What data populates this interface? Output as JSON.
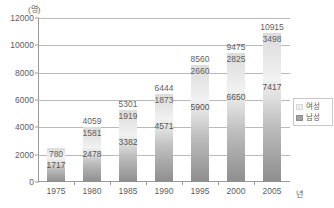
{
  "chart_data": {
    "type": "bar",
    "stacked": true,
    "title": "",
    "subtitle": "",
    "xlabel": "년",
    "ylabel": "",
    "yunit": "(명)",
    "ylim": [
      0,
      12000
    ],
    "ytick_labels": [
      "0",
      "2000",
      "4000",
      "6000",
      "8000",
      "10000",
      "12000"
    ],
    "ytick_values": [
      0,
      2000,
      4000,
      6000,
      8000,
      10000,
      12000
    ],
    "grid": true,
    "legend_position": "right",
    "categories": [
      "1975",
      "1980",
      "1985",
      "1990",
      "1995",
      "2000",
      "2005"
    ],
    "series": [
      {
        "name": "남성",
        "values": [
          1717,
          2478,
          3382,
          4571,
          5900,
          6650,
          7417
        ],
        "color": "#9d9d9d"
      },
      {
        "name": "여성",
        "values": [
          780,
          1581,
          1919,
          1873,
          2660,
          2825,
          3498
        ],
        "color": "#ececec"
      }
    ],
    "totals": [
      2497,
      4059,
      5301,
      6444,
      8560,
      9475,
      10915
    ],
    "total_labels": [
      "",
      "4059",
      "5301",
      "6444",
      "8560",
      "9475",
      "10915"
    ]
  },
  "legend": {
    "items": [
      {
        "label": "여성",
        "swatch": "female-swatch"
      },
      {
        "label": "남성",
        "swatch": "male-swatch"
      }
    ]
  },
  "axis": {
    "unit_label": "(명)",
    "x_title": "년"
  },
  "bars": [
    {
      "year": "1975",
      "male": "1717",
      "female": "780",
      "total": ""
    },
    {
      "year": "1980",
      "male": "2478",
      "female": "1581",
      "total": "4059"
    },
    {
      "year": "1985",
      "male": "3382",
      "female": "1919",
      "total": "5301"
    },
    {
      "year": "1990",
      "male": "4571",
      "female": "1873",
      "total": "6444"
    },
    {
      "year": "1995",
      "male": "5900",
      "female": "2660",
      "total": "8560"
    },
    {
      "year": "2000",
      "male": "6650",
      "female": "2825",
      "total": "9475"
    },
    {
      "year": "2005",
      "male": "7417",
      "female": "3498",
      "total": "10915"
    }
  ],
  "yticks": [
    {
      "label": "12000"
    },
    {
      "label": "10000"
    },
    {
      "label": "8000"
    },
    {
      "label": "6000"
    },
    {
      "label": "4000"
    },
    {
      "label": "2000"
    },
    {
      "label": "0"
    }
  ]
}
